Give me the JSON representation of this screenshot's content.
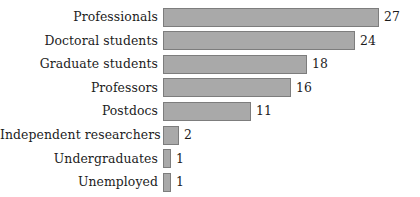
{
  "chart_data": {
    "type": "bar",
    "orientation": "horizontal",
    "title": "",
    "subtitle": "",
    "xlabel": "",
    "ylabel": "",
    "categories": [
      "Professionals",
      "Doctoral students",
      "Graduate students",
      "Professors",
      "Postdocs",
      "Independent researchers",
      "Undergraduates",
      "Unemployed"
    ],
    "values": [
      27,
      24,
      18,
      16,
      11,
      2,
      1,
      1
    ],
    "value_labels": [
      "27",
      "24",
      "18",
      "16",
      "11",
      "2",
      "1",
      "1"
    ],
    "xlim": [
      0,
      27
    ],
    "grid": false,
    "legend": null,
    "axes_visible": false,
    "bar_fill_color": "#a9a9a9",
    "bar_border_color": "#7d7d7d",
    "text_color": "#1c1c1c",
    "background_color": "#ffffff"
  },
  "layout": {
    "label_column_width_px": 158,
    "bar_origin_x_px": 163,
    "pixels_per_unit": 8,
    "row_pitch_px": 23.6,
    "first_row_top_px": 5,
    "bar_height_px": 19
  }
}
